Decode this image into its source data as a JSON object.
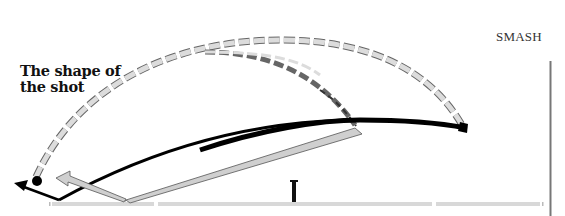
{
  "diagram": {
    "title_line1": "The shape of",
    "title_line2": "the shot",
    "shot_label": "SMASH",
    "colors": {
      "dashed_fill": "#dcdcdc",
      "dashed_stroke": "#666666",
      "trajectory": "#000000",
      "arrow_fill": "#cfcfcf",
      "court_line": "#d8d8d8",
      "net_post": "#111111",
      "wall_line": "#777777"
    },
    "elements": [
      "outer dashed arc (high clear path)",
      "inner dashed arc (drop path)",
      "thick black trajectory (smash)",
      "grey arrow (return)",
      "black arrow (return)",
      "net post",
      "court baseline",
      "right wall line",
      "shuttle dot"
    ]
  }
}
